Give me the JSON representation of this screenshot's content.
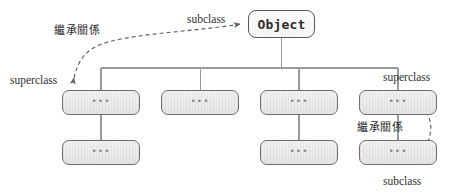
{
  "figure": {
    "type": "class-inheritance-hierarchy-diagram",
    "background_color": "#ffffff",
    "box_fill_color": "#eceaea",
    "box_border_color": "#6d6d6d",
    "root_fill_color": "#fdfdfd",
    "line_color": "#8a8a8a"
  },
  "root": {
    "label": "Object"
  },
  "placeholder_label": "•••",
  "level2": [
    {
      "label": "•••"
    },
    {
      "label": "•••"
    },
    {
      "label": "•••"
    },
    {
      "label": "•••"
    }
  ],
  "level3": [
    {
      "label": "•••"
    },
    {
      "label": "•••"
    },
    {
      "label": "•••"
    }
  ],
  "annotations": {
    "subclass_top": "subclass",
    "inheritance_left": "繼承關係",
    "superclass_left": "superclass",
    "superclass_right": "superclass",
    "inheritance_right": "繼承關係",
    "subclass_bottom": "subclass"
  }
}
